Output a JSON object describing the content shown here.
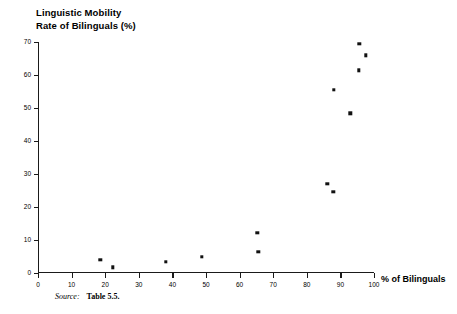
{
  "chart_data": {
    "type": "scatter",
    "title": "Linguistic Mobility",
    "subtitle": "Rate of Bilinguals (%)",
    "xlabel": "% of Bilinguals",
    "ylabel": "Rate of Bilinguals (%)",
    "xlim": [
      0,
      100
    ],
    "ylim": [
      0,
      70
    ],
    "grid": false,
    "legend": null,
    "xticks": [
      0,
      10,
      20,
      30,
      40,
      50,
      60,
      70,
      80,
      90,
      100
    ],
    "yticks": [
      0,
      10,
      20,
      30,
      40,
      50,
      60,
      70
    ],
    "xtick_labels": [
      "0",
      "10",
      "20",
      "30",
      "40",
      "50",
      "60",
      "70",
      "80",
      "90",
      "100"
    ],
    "ytick_labels": [
      "0",
      "10",
      "20",
      "30",
      "40",
      "50",
      "60",
      "70"
    ],
    "points": [
      {
        "x": 18.5,
        "y": 4.0
      },
      {
        "x": 22.2,
        "y": 1.7
      },
      {
        "x": 38.1,
        "y": 3.4
      },
      {
        "x": 48.7,
        "y": 4.9
      },
      {
        "x": 65.3,
        "y": 12.1
      },
      {
        "x": 65.6,
        "y": 6.5
      },
      {
        "x": 86.1,
        "y": 27.1
      },
      {
        "x": 87.9,
        "y": 24.6
      },
      {
        "x": 88.0,
        "y": 55.5
      },
      {
        "x": 93.0,
        "y": 48.4
      },
      {
        "x": 95.5,
        "y": 61.4
      },
      {
        "x": 95.6,
        "y": 69.5
      },
      {
        "x": 97.6,
        "y": 66.0
      }
    ],
    "annotations": {
      "source_label": "Source:",
      "source_text": "Table 5.5."
    }
  },
  "figure": {
    "title_line1": "Linguistic Mobility",
    "title_line2": "Rate of Bilinguals (%)",
    "x_axis_name": "% of Bilinguals",
    "source_label": "Source:",
    "source_text": "Table 5.5."
  }
}
